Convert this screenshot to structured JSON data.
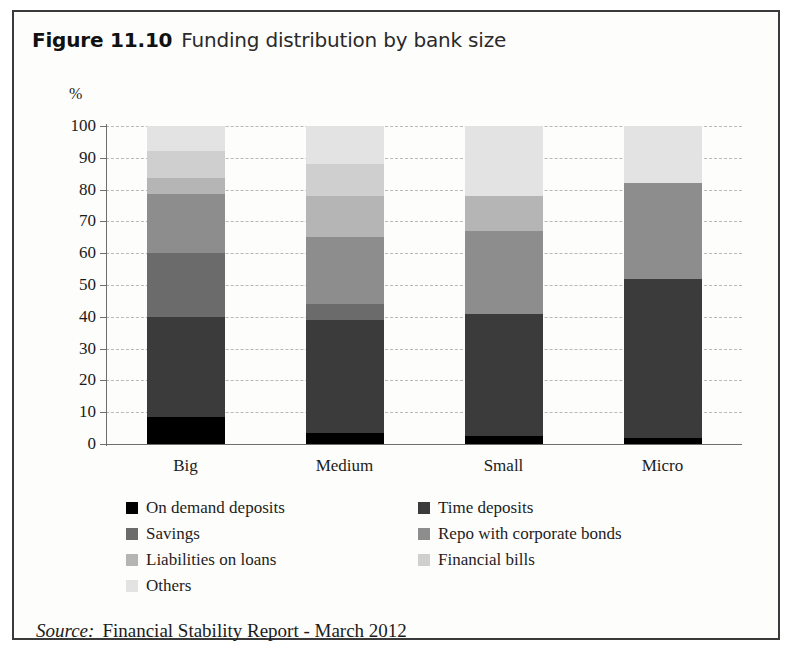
{
  "figure": {
    "number_label": "Figure 11.10",
    "title": "Funding distribution by bank size"
  },
  "source": {
    "label": "Source:",
    "text": "Financial Stability Report - March 2012"
  },
  "axis": {
    "unit": "%",
    "ticks": [
      "100",
      "90",
      "80",
      "70",
      "60",
      "50",
      "40",
      "30",
      "20",
      "10",
      "0"
    ]
  },
  "legend": {
    "items": [
      {
        "label": "On demand deposits",
        "color": "#000000"
      },
      {
        "label": "Time deposits",
        "color": "#3b3b3b"
      },
      {
        "label": "Savings",
        "color": "#6b6b6b"
      },
      {
        "label": "Repo with corporate bonds",
        "color": "#8d8d8d"
      },
      {
        "label": "Liabilities on loans",
        "color": "#b5b5b5"
      },
      {
        "label": "Financial bills",
        "color": "#cfcfcf"
      },
      {
        "label": "Others",
        "color": "#e3e3e3"
      }
    ]
  },
  "chart_data": {
    "type": "bar",
    "stacked": true,
    "title": "Funding distribution by bank size",
    "xlabel": "",
    "ylabel": "%",
    "ylim": [
      0,
      100
    ],
    "ytick_step": 10,
    "grid": true,
    "legend_position": "bottom",
    "categories": [
      "Big",
      "Medium",
      "Small",
      "Micro"
    ],
    "series": [
      {
        "name": "On demand deposits",
        "color": "#000000",
        "values": [
          8.5,
          3.5,
          2.5,
          2
        ]
      },
      {
        "name": "Time deposits",
        "color": "#3b3b3b",
        "values": [
          31.5,
          35.5,
          38.5,
          50
        ]
      },
      {
        "name": "Savings",
        "color": "#6b6b6b",
        "values": [
          20,
          5,
          0,
          0
        ]
      },
      {
        "name": "Repo with corporate bonds",
        "color": "#8d8d8d",
        "values": [
          18.5,
          21,
          26,
          30
        ]
      },
      {
        "name": "Liabilities on loans",
        "color": "#b5b5b5",
        "values": [
          5,
          13,
          11,
          0
        ]
      },
      {
        "name": "Financial bills",
        "color": "#cfcfcf",
        "values": [
          8.5,
          10,
          0,
          0
        ]
      },
      {
        "name": "Others",
        "color": "#e3e3e3",
        "values": [
          8,
          12,
          22,
          18
        ]
      }
    ]
  }
}
